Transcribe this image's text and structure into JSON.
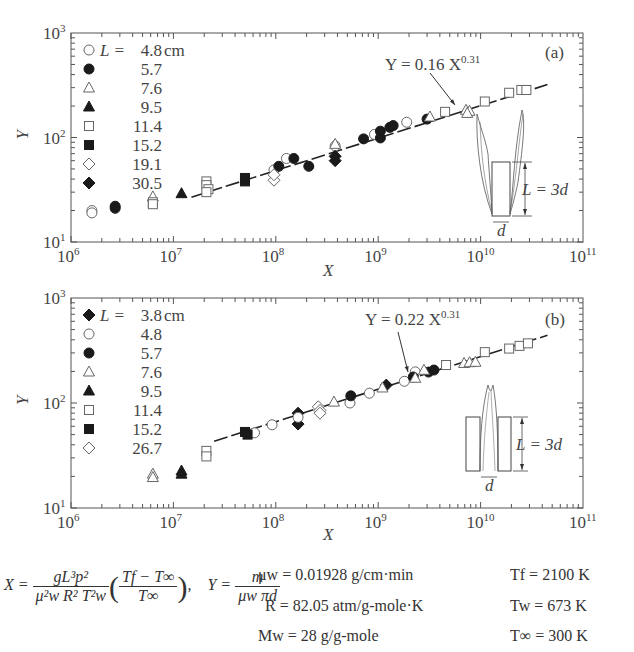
{
  "chart_data": [
    {
      "type": "scatter",
      "panel_label": "(a)",
      "xlabel": "X",
      "ylabel": "Y",
      "xscale": "log",
      "yscale": "log",
      "xlim": [
        1000000.0,
        100000000000.0
      ],
      "ylim": [
        10,
        1000
      ],
      "x_ticks": [
        {
          "base": "10",
          "exp": "6"
        },
        {
          "base": "10",
          "exp": "7"
        },
        {
          "base": "10",
          "exp": "8"
        },
        {
          "base": "10",
          "exp": "9"
        },
        {
          "base": "10",
          "exp": "10"
        },
        {
          "base": "10",
          "exp": "11"
        }
      ],
      "y_ticks": [
        {
          "base": "10",
          "exp": "1"
        },
        {
          "base": "10",
          "exp": "2"
        },
        {
          "base": "10",
          "exp": "3"
        }
      ],
      "legend_position": "top-left",
      "legend_prefix": "L =",
      "legend_unit": "cm",
      "fit": {
        "label_left": "Y = 0.16 X",
        "label_exp": "0.31",
        "coef": 0.16,
        "exponent": 0.31,
        "x_range": [
          15000000.0,
          45000000000.0
        ]
      },
      "diagram_label": "L = 3d",
      "diagram_d": "d",
      "series": [
        {
          "name": "4.8",
          "marker": "circle-open",
          "points": [
            [
              1600000.0,
              20
            ],
            [
              1600000.0,
              19
            ],
            [
              96000000.0,
              49
            ],
            [
              127000000.0,
              63
            ],
            [
              380000000.0,
              83
            ],
            [
              920000000.0,
              107
            ],
            [
              1900000000.0,
              140
            ]
          ]
        },
        {
          "name": "5.7",
          "marker": "circle-filled",
          "points": [
            [
              2700000.0,
              22
            ],
            [
              2700000.0,
              21
            ],
            [
              107000000.0,
              53
            ],
            [
              150000000.0,
              63
            ],
            [
              210000000.0,
              53
            ],
            [
              720000000.0,
              97
            ],
            [
              1050000000.0,
              115
            ],
            [
              1050000000.0,
              99
            ],
            [
              1300000000.0,
              125
            ],
            [
              1400000000.0,
              130
            ],
            [
              3000000000.0,
              150
            ]
          ]
        },
        {
          "name": "7.6",
          "marker": "triangle-open",
          "points": [
            [
              6300000.0,
              27
            ],
            [
              380000000.0,
              86
            ],
            [
              3200000000.0,
              157
            ],
            [
              7200000000.0,
              182
            ],
            [
              7800000000.0,
              178
            ],
            [
              7400000000.0,
              170
            ]
          ]
        },
        {
          "name": "9.5",
          "marker": "triangle-filled",
          "points": [
            [
              12000000.0,
              29
            ]
          ]
        },
        {
          "name": "11.4",
          "marker": "square-open",
          "points": [
            [
              6300000.0,
              24
            ],
            [
              6300000.0,
              23
            ],
            [
              21000000.0,
              38
            ],
            [
              21000000.0,
              35
            ],
            [
              22000000.0,
              32
            ],
            [
              21000000.0,
              30
            ],
            [
              4500000000.0,
              176
            ],
            [
              11000000000.0,
              221
            ],
            [
              19000000000.0,
              268
            ],
            [
              25000000000.0,
              285
            ],
            [
              28000000000.0,
              285
            ]
          ]
        },
        {
          "name": "15.2",
          "marker": "square-filled",
          "points": [
            [
              50000000.0,
              41
            ],
            [
              50000000.0,
              38
            ]
          ]
        },
        {
          "name": "19.1",
          "marker": "diamond-open",
          "points": [
            [
              96000000.0,
              39
            ],
            [
              96000000.0,
              44
            ]
          ]
        },
        {
          "name": "30.5",
          "marker": "diamond-filled",
          "points": [
            [
              380000000.0,
              66
            ],
            [
              380000000.0,
              60
            ]
          ]
        }
      ]
    },
    {
      "type": "scatter",
      "panel_label": "(b)",
      "xlabel": "X",
      "ylabel": "Y",
      "xscale": "log",
      "yscale": "log",
      "xlim": [
        1000000.0,
        100000000000.0
      ],
      "ylim": [
        10,
        1000
      ],
      "x_ticks": [
        {
          "base": "10",
          "exp": "6"
        },
        {
          "base": "10",
          "exp": "7"
        },
        {
          "base": "10",
          "exp": "8"
        },
        {
          "base": "10",
          "exp": "9"
        },
        {
          "base": "10",
          "exp": "10"
        },
        {
          "base": "10",
          "exp": "11"
        }
      ],
      "y_ticks": [
        {
          "base": "10",
          "exp": "1"
        },
        {
          "base": "10",
          "exp": "2"
        },
        {
          "base": "10",
          "exp": "3"
        }
      ],
      "legend_position": "top-left",
      "legend_prefix": "L =",
      "legend_unit": "cm",
      "fit": {
        "label_left": "Y = 0.22 X",
        "label_exp": "0.31",
        "coef": 0.22,
        "exponent": 0.31,
        "x_range": [
          25000000.0,
          45000000000.0
        ]
      },
      "diagram_label": "L = 3d",
      "diagram_d": "d",
      "series": [
        {
          "name": "3.8",
          "marker": "diamond-filled",
          "points": [
            [
              165000000.0,
              80
            ],
            [
              165000000.0,
              63
            ],
            [
              1200000000.0,
              148
            ]
          ]
        },
        {
          "name": "4.8",
          "marker": "circle-open",
          "points": [
            [
              62000000.0,
              52
            ],
            [
              92000000.0,
              62
            ],
            [
              165000000.0,
              73
            ],
            [
              530000000.0,
              100
            ],
            [
              820000000.0,
              124
            ],
            [
              1800000000.0,
              161
            ],
            [
              2300000000.0,
              198
            ]
          ]
        },
        {
          "name": "5.7",
          "marker": "circle-filled",
          "points": [
            [
              540000000.0,
              117
            ],
            [
              2200000000.0,
              177
            ],
            [
              3100000000.0,
              197
            ],
            [
              3500000000.0,
              206
            ]
          ]
        },
        {
          "name": "7.6",
          "marker": "triangle-open",
          "points": [
            [
              6300000.0,
              21
            ],
            [
              6300000.0,
              19.5
            ],
            [
              370000000.0,
              102
            ],
            [
              1100000000.0,
              139
            ],
            [
              2300000000.0,
              172
            ],
            [
              2800000000.0,
              205
            ],
            [
              6900000000.0,
              238
            ],
            [
              7800000000.0,
              242
            ],
            [
              8900000000.0,
              244
            ]
          ]
        },
        {
          "name": "9.5",
          "marker": "triangle-filled",
          "points": [
            [
              12000000.0,
              22.5
            ],
            [
              12000000.0,
              21
            ]
          ]
        },
        {
          "name": "11.4",
          "marker": "square-open",
          "points": [
            [
              21000000.0,
              35
            ],
            [
              21000000.0,
              31
            ],
            [
              4600000000.0,
              230
            ],
            [
              11000000000.0,
              305
            ],
            [
              19000000000.0,
              330
            ],
            [
              24000000000.0,
              350
            ],
            [
              29000000000.0,
              370
            ]
          ]
        },
        {
          "name": "15.2",
          "marker": "square-filled",
          "points": [
            [
              50000000.0,
              53
            ],
            [
              53000000.0,
              50
            ]
          ]
        },
        {
          "name": "26.7",
          "marker": "diamond-open",
          "points": [
            [
              260000000.0,
              92
            ],
            [
              270000000.0,
              85
            ],
            [
              270000000.0,
              80
            ]
          ]
        }
      ]
    }
  ],
  "formulas": {
    "x_def": {
      "lhs": "X =",
      "num": "gL³p²",
      "den": "μ²w R² T²w",
      "paren_num": "Tf − T∞",
      "paren_den": "T∞",
      "trail": ","
    },
    "y_def": {
      "lhs": "Y =",
      "num": "m",
      "den": "μw πd"
    }
  },
  "constants": [
    {
      "label": "μw = 0.01928 g/cm·min"
    },
    {
      "label": "R = 82.05 atm/g-mole·K"
    },
    {
      "label": "Mw = 28 g/g-mole"
    },
    {
      "label": "Tf = 2100 K"
    },
    {
      "label": "Tw = 673 K"
    },
    {
      "label": "T∞ = 300 K"
    }
  ]
}
